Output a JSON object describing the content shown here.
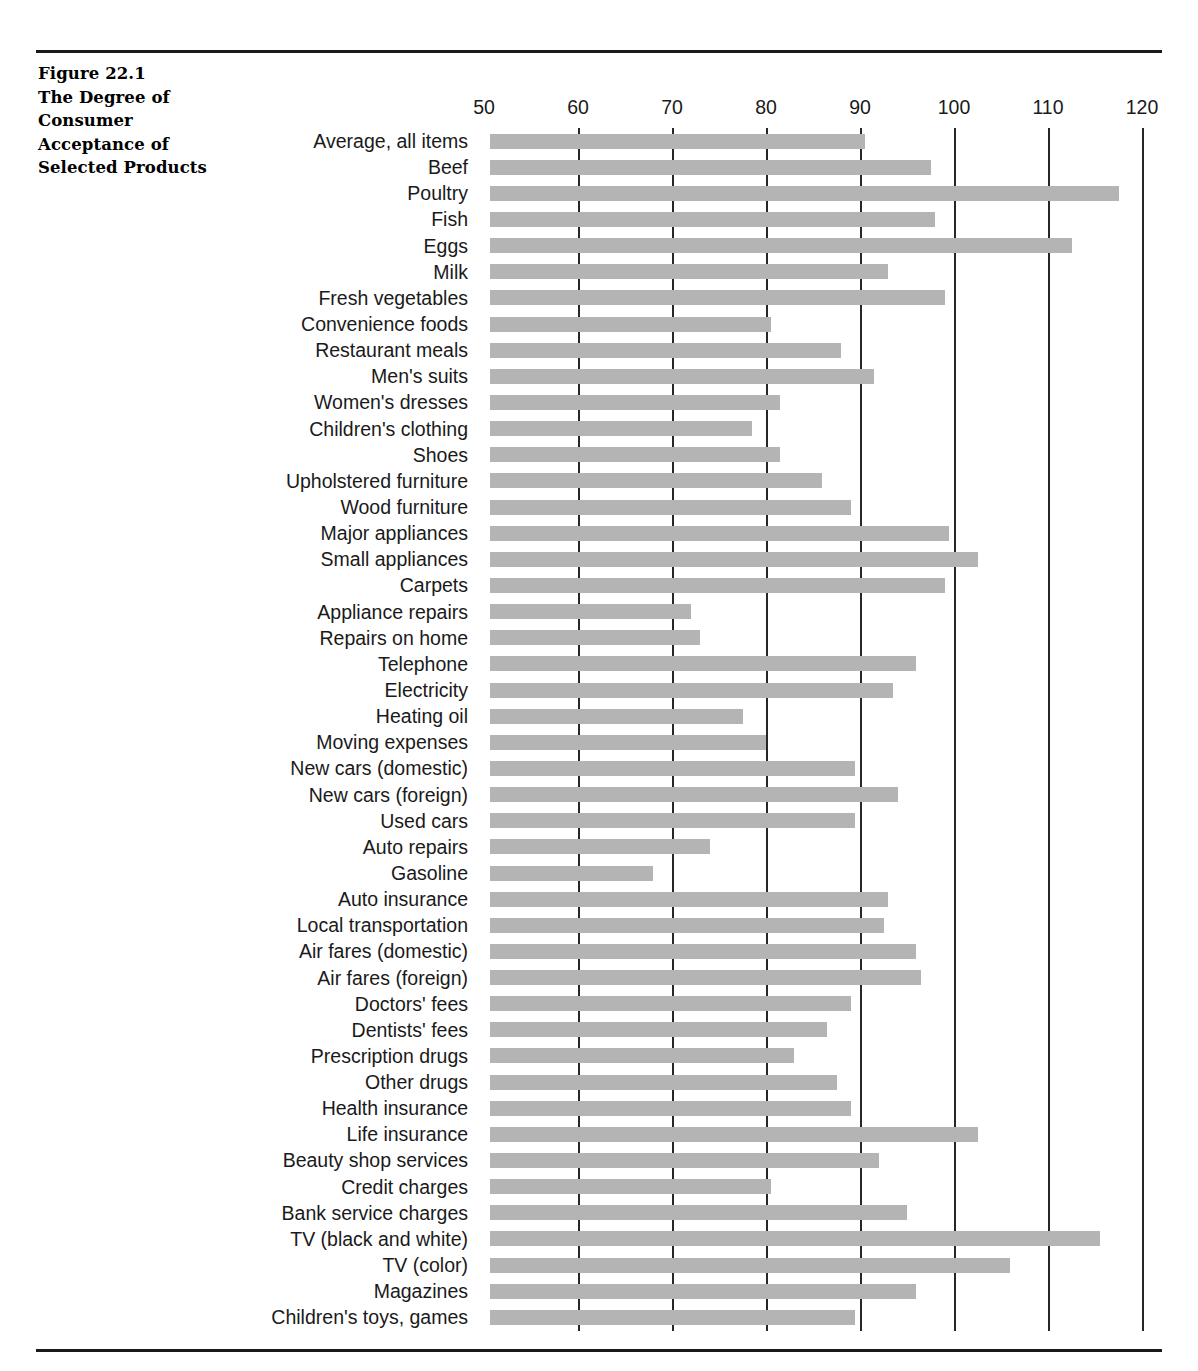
{
  "figure": {
    "title_lines": [
      "Figure 22.1",
      "The Degree of",
      "Consumer",
      "Acceptance of",
      "Selected Products"
    ]
  },
  "chart_data": {
    "type": "bar",
    "orientation": "horizontal",
    "xlabel": "",
    "ylabel": "",
    "xlim": [
      50,
      120
    ],
    "xticks": [
      50,
      60,
      70,
      80,
      90,
      100,
      110,
      120
    ],
    "grid": "vertical gridlines at each x tick",
    "legend": "none",
    "bar_color": "#b4b4b4",
    "baseline": 50,
    "categories": [
      "Average, all items",
      "Beef",
      "Poultry",
      "Fish",
      "Eggs",
      "Milk",
      "Fresh vegetables",
      "Convenience foods",
      "Restaurant meals",
      "Men's suits",
      "Women's dresses",
      "Children's clothing",
      "Shoes",
      "Upholstered furniture",
      "Wood furniture",
      "Major appliances",
      "Small appliances",
      "Carpets",
      "Appliance repairs",
      "Repairs on home",
      "Telephone",
      "Electricity",
      "Heating oil",
      "Moving expenses",
      "New cars (domestic)",
      "New cars (foreign)",
      "Used cars",
      "Auto repairs",
      "Gasoline",
      "Auto insurance",
      "Local transportation",
      "Air fares (domestic)",
      "Air fares (foreign)",
      "Doctors' fees",
      "Dentists' fees",
      "Prescription drugs",
      "Other drugs",
      "Health insurance",
      "Life insurance",
      "Beauty shop services",
      "Credit charges",
      "Bank service charges",
      "TV (black and white)",
      "TV (color)",
      "Magazines",
      "Children's toys, games"
    ],
    "values": [
      90.5,
      97.5,
      117.5,
      98,
      112.5,
      93,
      99,
      80.5,
      88,
      91.5,
      81.5,
      78.5,
      81.5,
      86,
      89,
      99.5,
      102.5,
      99,
      72,
      73,
      96,
      93.5,
      77.5,
      80,
      89.5,
      94,
      89.5,
      74,
      68,
      93,
      92.5,
      96,
      96.5,
      89,
      86.5,
      83,
      87.5,
      89,
      102.5,
      92,
      80.5,
      95,
      115.5,
      106,
      96,
      89.5
    ]
  }
}
